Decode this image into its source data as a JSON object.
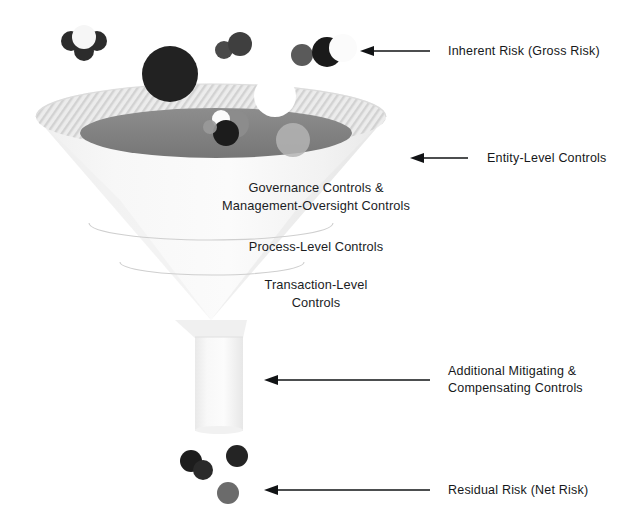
{
  "diagram": {
    "funnel_labels": [
      {
        "id": "governance",
        "text": "Governance Controls &\nManagement-Oversight Controls"
      },
      {
        "id": "process",
        "text": "Process-Level Controls"
      },
      {
        "id": "transaction",
        "text": "Transaction-Level\nControls"
      }
    ],
    "callouts": [
      {
        "id": "inherent-risk",
        "text": "Inherent Risk (Gross Risk)"
      },
      {
        "id": "entity-level-controls",
        "text": "Entity-Level Controls"
      },
      {
        "id": "additional-mitigating",
        "text": "Additional Mitigating &\nCompensating Controls"
      },
      {
        "id": "residual-risk",
        "text": "Residual Risk (Net Risk)"
      }
    ],
    "colors": {
      "text": "#16181a",
      "arrow": "#111315",
      "funnel_body": "#f2f2f2",
      "funnel_rim_hatch": "#d4d4d4",
      "funnel_inner": "#808080",
      "ball_black": "#1e1e1e",
      "ball_dark_gray": "#3d3d3d",
      "ball_mid_gray": "#707070",
      "ball_light_gray": "#9a9a9a",
      "ball_white": "#fafafa",
      "divider": "#cfcfcf"
    },
    "risk_balls": {
      "top_group_left": [
        "dark",
        "dark",
        "dark",
        "white"
      ],
      "top_group_big": [
        "black-large"
      ],
      "top_group_middle": [
        "gray",
        "gray"
      ],
      "top_group_right": [
        "gray",
        "black",
        "white"
      ],
      "inside_rim": [
        "white",
        "gray",
        "black",
        "light-gray",
        "white-notch"
      ],
      "bottom_output": [
        "black",
        "black",
        "dark-gray",
        "mid-gray"
      ]
    }
  }
}
